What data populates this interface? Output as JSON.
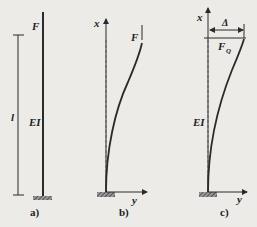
{
  "figure": {
    "panels": [
      {
        "caption": "a)",
        "labels": {
          "force": "F",
          "stiffness": "EI",
          "length": "l"
        }
      },
      {
        "caption": "b)",
        "labels": {
          "force": "F",
          "x_axis": "x",
          "y_axis": "y"
        }
      },
      {
        "caption": "c)",
        "labels": {
          "force": "F",
          "force_sub": "Q",
          "stiffness": "EI",
          "deflection": "Δ",
          "x_axis": "x",
          "y_axis": "y"
        }
      }
    ],
    "colors": {
      "line": "#2a2a2a",
      "background": "#ecebe8",
      "dashed": "#555555"
    }
  }
}
